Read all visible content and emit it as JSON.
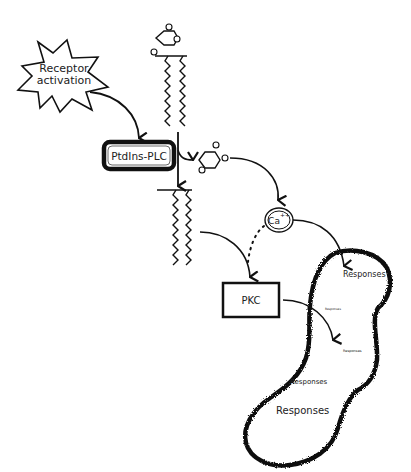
{
  "diagram": {
    "nodes": {
      "receptor": {
        "line1": "Receptor",
        "line2": "activation"
      },
      "plc": {
        "label": "PtdIns-PLC"
      },
      "calcium": {
        "label": "Ca",
        "superscript": "++"
      },
      "pkc": {
        "label": "PKC"
      }
    },
    "responses": [
      {
        "label": "Responses",
        "size": "medium"
      },
      {
        "label": "Responses",
        "size": "tiny"
      },
      {
        "label": "Responses",
        "size": "tiny"
      },
      {
        "label": "Responses",
        "size": "medium"
      },
      {
        "label": "Responses",
        "size": "large"
      }
    ],
    "colors": {
      "ink": "#111111",
      "background": "#ffffff"
    }
  }
}
